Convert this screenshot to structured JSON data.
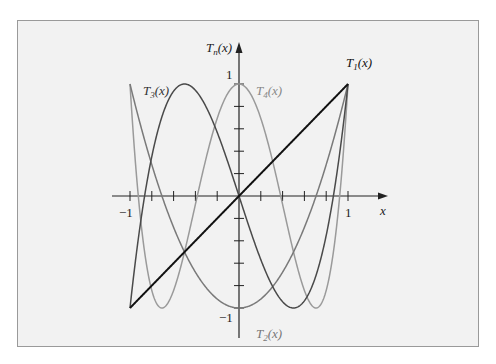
{
  "chart_data": {
    "type": "line",
    "title": "",
    "xlabel": "x",
    "ylabel": "T_n(x)",
    "xlim": [
      -1,
      1
    ],
    "ylim": [
      -1,
      1
    ],
    "x_ticks": [
      -1,
      -0.8,
      -0.6,
      -0.4,
      -0.2,
      0,
      0.2,
      0.4,
      0.6,
      0.8,
      1
    ],
    "x_tick_labels": [
      "-1",
      "1"
    ],
    "y_ticks": [
      -1,
      -0.8,
      -0.6,
      -0.4,
      -0.2,
      0,
      0.2,
      0.4,
      0.6,
      0.8,
      1
    ],
    "y_tick_labels": [
      "1",
      "-1"
    ],
    "grid": false,
    "legend": "inline labels",
    "series": [
      {
        "name": "T1(x)",
        "formula": "x",
        "color": "#111111",
        "label_pos": [
          0.98,
          1.1
        ]
      },
      {
        "name": "T2(x)",
        "formula": "2x^2 - 1",
        "color": "#7a7a7a",
        "label_pos": [
          0.05,
          -1.1
        ]
      },
      {
        "name": "T3(x)",
        "formula": "4x^3 - 3x",
        "color": "#4a4a4a",
        "label_pos": [
          -0.85,
          0.85
        ]
      },
      {
        "name": "T4(x)",
        "formula": "8x^4 - 8x^2 + 1",
        "color": "#9a9a9a",
        "label_pos": [
          0.1,
          0.85
        ]
      }
    ]
  },
  "labels": {
    "y_axis": {
      "main": "T",
      "sub": "n",
      "arg": "(x)"
    },
    "x_axis": "x",
    "y_one": "1",
    "y_neg_one": "−1",
    "x_one": "1",
    "x_neg_one": "−1",
    "t1": {
      "main": "T",
      "sub": "1",
      "arg": "(x)"
    },
    "t2": {
      "main": "T",
      "sub": "2",
      "arg": "(x)"
    },
    "t3": {
      "main": "T",
      "sub": "3",
      "arg": "(x)"
    },
    "t4": {
      "main": "T",
      "sub": "4",
      "arg": "(x)"
    }
  }
}
